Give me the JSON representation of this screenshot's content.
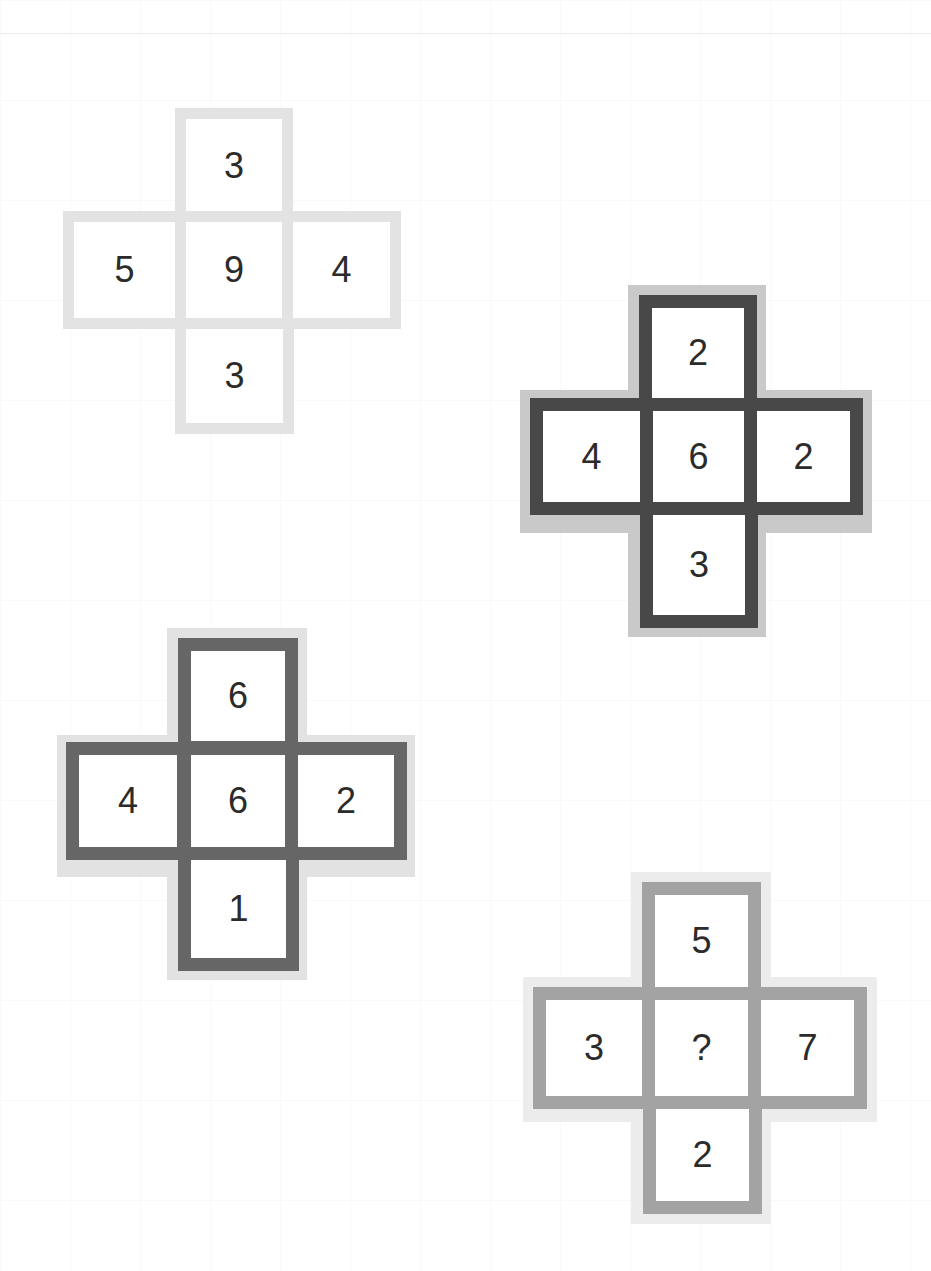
{
  "puzzle": {
    "type": "number-cross-sequence",
    "crosses": [
      {
        "id": "cross-1",
        "top": "3",
        "left": "5",
        "center": "9",
        "right": "4",
        "bottom": "3",
        "border_color": "#e3e3e3",
        "halo_color": "#e3e3e3"
      },
      {
        "id": "cross-2",
        "top": "2",
        "left": "4",
        "center": "6",
        "right": "2",
        "bottom": "3",
        "border_color": "#484848",
        "halo_color": "#c9c9c9"
      },
      {
        "id": "cross-3",
        "top": "6",
        "left": "4",
        "center": "6",
        "right": "2",
        "bottom": "1",
        "border_color": "#666666",
        "halo_color": "#e2e2e2"
      },
      {
        "id": "cross-4",
        "top": "5",
        "left": "3",
        "center": "?",
        "right": "7",
        "bottom": "2",
        "border_color": "#a3a3a3",
        "halo_color": "#ececec"
      }
    ]
  }
}
